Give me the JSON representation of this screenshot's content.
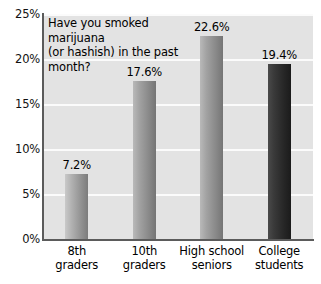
{
  "chart_data": {
    "type": "bar",
    "title": "",
    "question": [
      "Have you smoked marijuana",
      "(or hashish) in the past",
      "month?"
    ],
    "categories": [
      "8th graders",
      "10th graders",
      "High school seniors",
      "College students"
    ],
    "category_lines": [
      [
        "8th",
        "graders"
      ],
      [
        "10th",
        "graders"
      ],
      [
        "High school",
        "seniors"
      ],
      [
        "College",
        "students"
      ]
    ],
    "values": [
      7.2,
      17.6,
      22.6,
      19.4
    ],
    "data_labels": [
      "7.2%",
      "17.6%",
      "22.6%",
      "19.4%"
    ],
    "xlabel": "",
    "ylabel": "",
    "ylim": [
      0,
      25
    ],
    "yticks": [
      0,
      5,
      10,
      15,
      20,
      25
    ],
    "ytick_labels": [
      "0%",
      "5%",
      "10%",
      "15%",
      "20%",
      "25%"
    ],
    "grid": true,
    "legend": "none",
    "bar_shades": [
      "shade-light",
      "shade-mid",
      "shade-mid",
      "shade-dark"
    ],
    "colors": {
      "plot_background": "#e3e3e3",
      "gridline": "#fbfbfb",
      "axis": "#5b5b5b",
      "bar_light": "#a9a9a9",
      "bar_mid": "#9a9a9a",
      "bar_dark": "#2a2a2a",
      "text": "#000000"
    }
  }
}
